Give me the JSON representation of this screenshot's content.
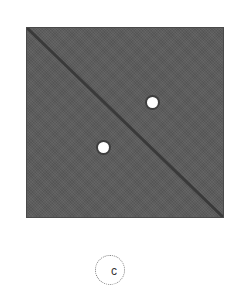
{
  "figure": {
    "label": "c",
    "square": {
      "fill": "#5c5c5c"
    },
    "diagonal": {
      "from": "top-left",
      "to": "bottom-right"
    },
    "dots": [
      {
        "name": "upper-right-dot",
        "color": "#ffffff"
      },
      {
        "name": "lower-left-dot",
        "color": "#ffffff"
      }
    ]
  }
}
